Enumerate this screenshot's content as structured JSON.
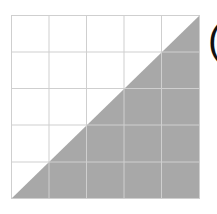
{
  "diagram": {
    "grid": {
      "rows": 5,
      "cols": 5,
      "line_color": "#cfcfcf",
      "background": "#ffffff"
    },
    "shaded_region": {
      "shape": "triangle",
      "description": "lower-right half below the diagonal from bottom-left to top-right",
      "fill": "#a8a8a8"
    },
    "label": "("
  }
}
